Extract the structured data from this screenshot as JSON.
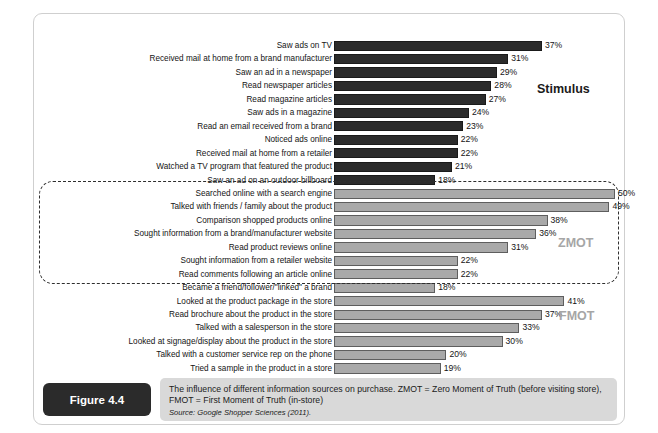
{
  "figure": {
    "badge_label": "Figure 4.4",
    "caption": "The influence of different information sources on purchase. ZMOT = Zero Moment of Truth (before visiting store), FMOT = First Moment of Truth (in-store)",
    "source": "Source: Google Shopper Sciences (2011)."
  },
  "groups": {
    "stimulus_label": "Stimulus",
    "zmot_label": "ZMOT",
    "fmot_label": "FMOT"
  },
  "colors": {
    "stimulus_bar": "#2b2b2b",
    "zmot_bar": "#a9a9a9",
    "fmot_bar": "#a9a9a9",
    "caption_background": "#d9d9d9",
    "badge_background": "#2b2b2b",
    "group_tag_muted": "#a6a6a6"
  },
  "chart_data": {
    "type": "bar",
    "orientation": "horizontal",
    "title": "",
    "xlabel": "",
    "ylabel": "",
    "xlim": [
      0,
      50
    ],
    "grid": false,
    "legend": "none",
    "value_suffix": "%",
    "categories": [
      "Saw ads on TV",
      "Received mail at home from a brand manufacturer",
      "Saw an ad in a newspaper",
      "Read newspaper articles",
      "Read magazine articles",
      "Saw ads in a magazine",
      "Read an email received from a brand",
      "Noticed ads online",
      "Received mail at home from a retailer",
      "Watched a TV program that featured the product",
      "Saw an ad on an outdoor billboard",
      "Searched online with a search engine",
      "Talked with friends / family about the product",
      "Comparison shopped products online",
      "Sought information from a brand/manufacturer website",
      "Read product reviews online",
      "Sought information from a retailer website",
      "Read comments following an article online",
      "Became a friend/follower/\"linked\" a brand",
      "Looked at the product package in the store",
      "Read brochure about the product in the store",
      "Talked with a salesperson in the store",
      "Looked at signage/display about the product in the store",
      "Talked with a customer service rep on the phone",
      "Tried a sample in the product in a store"
    ],
    "values": [
      37,
      31,
      29,
      28,
      27,
      24,
      23,
      22,
      22,
      21,
      18,
      50,
      49,
      38,
      36,
      31,
      22,
      22,
      18,
      41,
      37,
      33,
      30,
      20,
      19
    ],
    "value_labels": [
      "37%",
      "31%",
      "29%",
      "28%",
      "27%",
      "24%",
      "23%",
      "22%",
      "22%",
      "21%",
      "18%",
      "50%",
      "49%",
      "38%",
      "36%",
      "31%",
      "22%",
      "22%",
      "18%",
      "41%",
      "37%",
      "33%",
      "30%",
      "20%",
      "19%"
    ],
    "group_of_bar": [
      "stimulus",
      "stimulus",
      "stimulus",
      "stimulus",
      "stimulus",
      "stimulus",
      "stimulus",
      "stimulus",
      "stimulus",
      "stimulus",
      "stimulus",
      "zmot",
      "zmot",
      "zmot",
      "zmot",
      "zmot",
      "zmot",
      "zmot",
      "zmot",
      "fmot",
      "fmot",
      "fmot",
      "fmot",
      "fmot",
      "fmot"
    ],
    "groups": [
      {
        "name": "Stimulus",
        "first_index": 0,
        "last_index": 10
      },
      {
        "name": "ZMOT",
        "first_index": 11,
        "last_index": 18
      },
      {
        "name": "FMOT",
        "first_index": 19,
        "last_index": 24
      }
    ]
  }
}
